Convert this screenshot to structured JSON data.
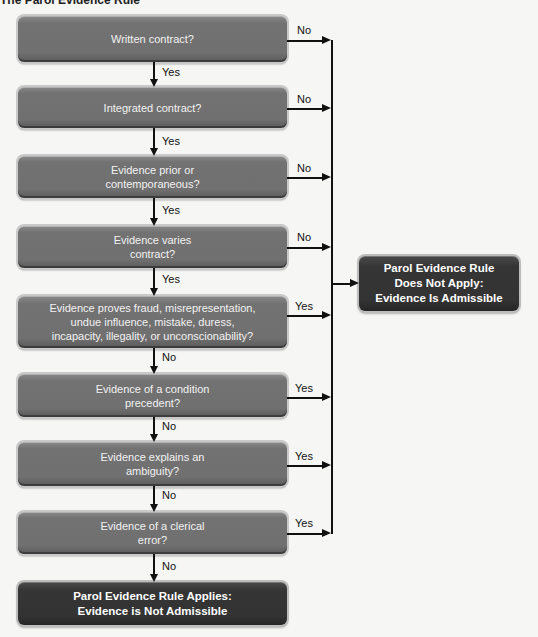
{
  "title": "The Parol Evidence Rule",
  "nodes": [
    {
      "id": "written",
      "text": "Written contract?",
      "yes": "next",
      "no": "admissible"
    },
    {
      "id": "integrated",
      "text": "Integrated contract?",
      "yes": "next",
      "no": "admissible"
    },
    {
      "id": "prior",
      "text": "Evidence prior or\ncontemporaneous?",
      "yes": "next",
      "no": "admissible"
    },
    {
      "id": "varies",
      "text": "Evidence varies\ncontract?",
      "yes": "next",
      "no": "admissible"
    },
    {
      "id": "fraud",
      "text": "Evidence proves fraud, misrepresentation,\nundue influence, mistake, duress,\nincapacity, illegality, or unconscionability?",
      "yes": "admissible",
      "no": "next"
    },
    {
      "id": "condition",
      "text": "Evidence of a condition\nprecedent?",
      "yes": "admissible",
      "no": "next"
    },
    {
      "id": "ambiguity",
      "text": "Evidence explains an\nambiguity?",
      "yes": "admissible",
      "no": "next"
    },
    {
      "id": "clerical",
      "text": "Evidence of a clerical\nerror?",
      "yes": "admissible",
      "no": "not_admissible"
    }
  ],
  "outcomes": {
    "admissible": "Parol Evidence Rule\nDoes Not Apply:\nEvidence Is Admissible",
    "not_admissible": "Parol Evidence Rule Applies:\nEvidence is Not Admissible"
  },
  "edge_labels": {
    "down": [
      "Yes",
      "Yes",
      "Yes",
      "Yes",
      "No",
      "No",
      "No",
      "No"
    ],
    "right": [
      "No",
      "No",
      "No",
      "No",
      "Yes",
      "Yes",
      "Yes",
      "Yes"
    ]
  }
}
